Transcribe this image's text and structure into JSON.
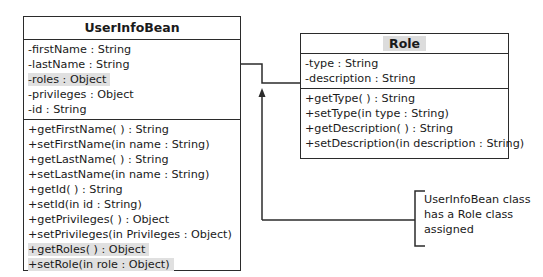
{
  "classes": {
    "user_info_bean": {
      "name": "UserInfoBean",
      "attributes": [
        {
          "text": "-firstName : String",
          "highlight": false
        },
        {
          "text": "-lastName : String",
          "highlight": false
        },
        {
          "text": "-roles : Object",
          "highlight": true
        },
        {
          "text": "-privileges : Object",
          "highlight": false
        },
        {
          "text": "-id : String",
          "highlight": false
        }
      ],
      "methods": [
        {
          "text": "+getFirstName( ) : String",
          "highlight": false
        },
        {
          "text": "+setFirstName(in name : String)",
          "highlight": false
        },
        {
          "text": "+getLastName( ) : String",
          "highlight": false
        },
        {
          "text": "+setLastName(in name : String)",
          "highlight": false
        },
        {
          "text": "+getId( ) : String",
          "highlight": false
        },
        {
          "text": "+setId(in id : String)",
          "highlight": false
        },
        {
          "text": "+getPrivileges( ) : Object",
          "highlight": false
        },
        {
          "text": "+setPrivileges(in Privileges : Object)",
          "highlight": false
        },
        {
          "text": "+getRoles( ) : Object",
          "highlight": true
        },
        {
          "text": "+setRole(in role : Object)",
          "highlight": true
        }
      ]
    },
    "role": {
      "name": "Role",
      "attributes": [
        {
          "text": "-type : String",
          "highlight": false
        },
        {
          "text": "-description : String",
          "highlight": false
        }
      ],
      "methods": [
        {
          "text": "+getType( ) : String",
          "highlight": false
        },
        {
          "text": "+setType(in type : String)",
          "highlight": false
        },
        {
          "text": "+getDescription( ) : String",
          "highlight": false
        },
        {
          "text": "+setDescription(in description : String)",
          "highlight": false
        }
      ]
    }
  },
  "annotation": {
    "lines": [
      "UserInfoBean class",
      "has a Role class",
      "assigned"
    ]
  },
  "colors": {
    "line": "#2b2b2b",
    "highlight": "#e0e0e0"
  }
}
